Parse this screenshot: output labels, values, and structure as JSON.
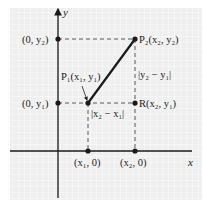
{
  "diagram": {
    "type": "coordinate-plane",
    "axes": {
      "x_label": "x",
      "y_label": "y"
    },
    "points": {
      "P1": {
        "label": "P₁(x₁, y₁)",
        "x": 88,
        "y": 103
      },
      "P2": {
        "label": "P₂(x₂, y₂)",
        "x": 135,
        "y": 39
      },
      "R": {
        "label": "R(x₂, y₁)",
        "x": 135,
        "y": 103
      },
      "y_axis_y2": {
        "label": "(0, y₂)",
        "x": 58,
        "y": 39
      },
      "y_axis_y1": {
        "label": "(0, y₁)",
        "x": 58,
        "y": 103
      },
      "x_axis_x1": {
        "label": "(x₁, 0)",
        "x": 88,
        "y": 151
      },
      "x_axis_x2": {
        "label": "(x₂, 0)",
        "x": 135,
        "y": 151
      }
    },
    "distances": {
      "horizontal": "|x₂ − x₁|",
      "vertical": "|y₂ − y₁|"
    },
    "colors": {
      "grid_bg": "#f1f1f1",
      "grid_line": "#ffffff",
      "ink": "#1a1a1a"
    }
  }
}
